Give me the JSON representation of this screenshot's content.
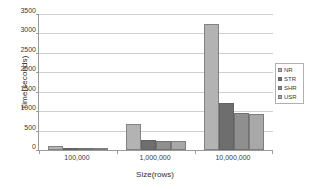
{
  "chart_data": {
    "type": "bar",
    "title": "",
    "subtitle": "",
    "xlabel": "Size(rows)",
    "ylabel": "Time(seconds)",
    "categories": [
      "100,000",
      "1,000,000",
      "10,000,000"
    ],
    "series": [
      {
        "name": "NR",
        "values": [
          95,
          670,
          3250
        ],
        "color": "#b3b3b3"
      },
      {
        "name": "STR",
        "values": [
          48,
          270,
          1220
        ],
        "color": "#6e6e6e"
      },
      {
        "name": "SHR",
        "values": [
          45,
          225,
          960
        ],
        "color": "#8f8f8f"
      },
      {
        "name": "USR",
        "values": [
          48,
          225,
          930
        ],
        "color": "#a8a8a8"
      }
    ],
    "ylim": [
      0,
      3500
    ],
    "ytick_step": 500,
    "yticks": [
      "0",
      "500",
      "1000",
      "1500",
      "2000",
      "2500",
      "3000",
      "3500"
    ],
    "grid": "horizontal",
    "legend_position": "right",
    "legend_entries": [
      "NR",
      "STR",
      "SHR",
      "USR"
    ],
    "plot_background": "#ffffff",
    "gridline_color": "#cfcfcf",
    "axis_color": "#9a9a9a"
  }
}
